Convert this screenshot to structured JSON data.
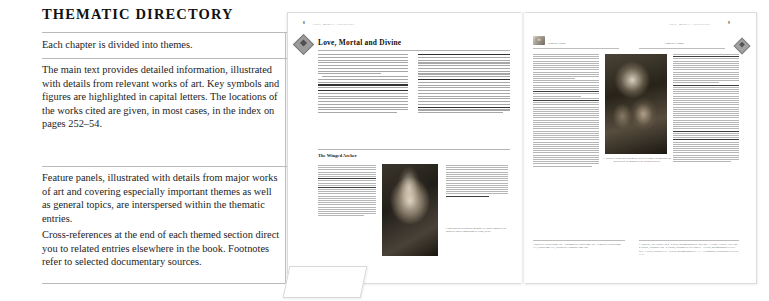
{
  "explainer": {
    "title": "THEMATIC DIRECTORY",
    "blocks": [
      {
        "id": "chapter-themes",
        "text": "Each chapter is divided into themes."
      },
      {
        "id": "main-text",
        "text": "The main text provides detailed information, illustrated with details from relevant works of art. Key symbols and figures are highlighted in capital letters. The locations of the works cited are given, in most cases, in the index on pages 252–54."
      },
      {
        "id": "feature-panels",
        "text": "Feature panels, illustrated with details from major works of art and covering especially important themes as well as general topics, are interspersed within the thematic entries."
      },
      {
        "id": "cross-references",
        "text": "Cross-references at the end of each themed section direct you to related entries elsewhere in the book. Footnotes refer to selected documentary sources."
      }
    ]
  },
  "spread": {
    "left_page": {
      "running_head": "LOVE, MORTAL AND DIVINE",
      "folio": "8",
      "ornament": "diamond-ornament",
      "section_title": "Love, Mortal and Divine",
      "feature_panel": {
        "title": "The Winged Archer",
        "image_alt": "cupid-detail-image",
        "caption": "Cupid appears in a golden ink made in Lucas Cranach's Old Masters Cupid Complaining to Venus, detail."
      }
    },
    "right_page": {
      "running_head": "LOVE, MORTAL AND DIVINE",
      "folio": "9",
      "ornament": "diamond-ornament",
      "plate_caption": "A. Jacopo's Chiaro and Endymion, detail of a small leg embodies the devotion of the goddess to the sensual beloved.",
      "thumb_label_left": "Venus see Cupid",
      "thumb_label_right": "Chaos see Europa",
      "cross_references": "Adonis see Flowers page 112 · Endymion see Moon page 186 · Venus see Flowers page 117, Graces page 177, Europa see Constancy page 140.",
      "footnotes": "1 Apuleius, The Golden Ass 4 · 2 Ovid, Metamorphoses II. 260–297 · 3 Virgil, Aeneid I. 657–722 · 4 Hesiod, Theogony 188 · 5 Lucian, Dialogues of the Gods 17 · 6 Ovid, Metamorphoses II. 833–875 · 7 Ovid, Heroides XVI · 8 Ovid, Metamorphoses IV. 1–3 · 9 Pausanias, Description of Greece V. 11."
    }
  },
  "colors": {
    "rule": "#b9b9b9",
    "page_border": "#dcdcdc",
    "text": "#1a1a1a",
    "muted": "#7a7a7a"
  }
}
